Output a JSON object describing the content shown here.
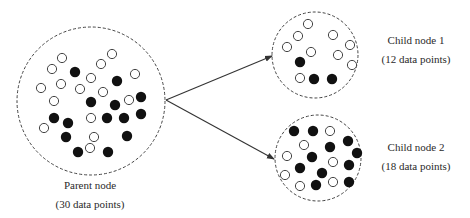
{
  "diagram": {
    "type": "decision-tree-split",
    "colors": {
      "stroke": "#444444",
      "filled_point": "#111111",
      "open_point_fill": "#ffffff",
      "background": "#ffffff"
    },
    "parent": {
      "name": "Parent node",
      "count_label": "(30 data points)",
      "center": [
        91,
        101
      ],
      "radius": 74,
      "points": {
        "open": [
          [
            62,
            58
          ],
          [
            52,
            69
          ],
          [
            41,
            88
          ],
          [
            61,
            84
          ],
          [
            80,
            89
          ],
          [
            91,
            78
          ],
          [
            54,
            101
          ],
          [
            101,
            64
          ],
          [
            112,
            54
          ],
          [
            135,
            74
          ],
          [
            103,
            92
          ],
          [
            129,
            100
          ],
          [
            44,
            128
          ],
          [
            91,
            118
          ],
          [
            94,
            137
          ],
          [
            90,
            148
          ]
        ],
        "filled": [
          [
            75,
            72
          ],
          [
            117,
            81
          ],
          [
            91,
            102
          ],
          [
            115,
            105
          ],
          [
            141,
            97
          ],
          [
            54,
            118
          ],
          [
            68,
            123
          ],
          [
            107,
            118
          ],
          [
            124,
            118
          ],
          [
            141,
            114
          ],
          [
            66,
            137
          ],
          [
            127,
            136
          ],
          [
            78,
            152
          ],
          [
            108,
            152
          ]
        ]
      }
    },
    "children": [
      {
        "name": "Child node 1",
        "count_label": "(12 data points)",
        "center": [
          315,
          55
        ],
        "radius": 43,
        "points": {
          "open": [
            [
              308,
              24
            ],
            [
              298,
              36
            ],
            [
              287,
              47
            ],
            [
              311,
              52
            ],
            [
              333,
              35
            ],
            [
              350,
              45
            ],
            [
              338,
              55
            ],
            [
              352,
              65
            ],
            [
              300,
              78
            ]
          ],
          "filled": [
            [
              300,
              62
            ],
            [
              314,
              79
            ],
            [
              332,
              79
            ]
          ]
        }
      },
      {
        "name": "Child node 2",
        "count_label": "(18 data points)",
        "center": [
          318,
          158
        ],
        "radius": 43,
        "points": {
          "open": [
            [
              330,
              131
            ],
            [
              304,
              145
            ],
            [
              287,
              156
            ],
            [
              333,
              162
            ],
            [
              285,
              175
            ],
            [
              300,
              186
            ],
            [
              333,
              182
            ]
          ],
          "filled": [
            [
              294,
              131
            ],
            [
              313,
              131
            ],
            [
              348,
              141
            ],
            [
              330,
              147
            ],
            [
              357,
              153
            ],
            [
              312,
              157
            ],
            [
              349,
              165
            ],
            [
              300,
              168
            ],
            [
              322,
              173
            ],
            [
              316,
              185
            ],
            [
              349,
              182
            ]
          ]
        }
      }
    ],
    "edges": [
      {
        "from": [
          166,
          100
        ],
        "to": [
          272,
          56
        ]
      },
      {
        "from": [
          166,
          100
        ],
        "to": [
          274,
          159
        ]
      }
    ]
  }
}
